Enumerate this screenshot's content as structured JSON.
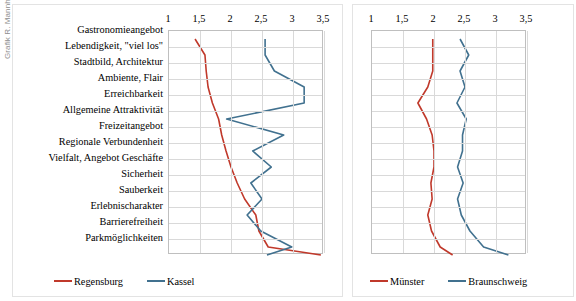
{
  "credit": "Grafik R. Mannheim",
  "axis": {
    "tick_labels": [
      "1",
      "1,5",
      "2",
      "2,5",
      "3",
      "3,5"
    ],
    "tick_values": [
      1,
      1.5,
      2,
      2.5,
      3,
      3.5
    ],
    "min": 1,
    "max": 3.5
  },
  "categories": [
    "Gastronomieangebot",
    "Lebendigkeit, \"viel los\"",
    "Stadtbild, Architektur",
    "Ambiente, Flair",
    "Erreichbarkeit",
    "Allgemeine Attraktivität",
    "Freizeitangebot",
    "Regionale Verbundenheit",
    "Vielfalt, Angebot Geschäfte",
    "Sicherheit",
    "Sauberkeit",
    "Erlebnischarakter",
    "Barrierefreiheit",
    "Parkmöglichkeiten"
  ],
  "colors": {
    "red": "#c0392b",
    "blue": "#41718f",
    "grid": "#d9d9d9",
    "frame": "#bfbfbf"
  },
  "left_legend": [
    {
      "label": "Regensburg",
      "color": "#c0392b"
    },
    {
      "label": "Kassel",
      "color": "#41718f"
    }
  ],
  "right_legend": [
    {
      "label": "Münster",
      "color": "#c0392b"
    },
    {
      "label": "Braunschweig",
      "color": "#41718f"
    }
  ],
  "chart_data": [
    {
      "type": "line",
      "title": "",
      "orientation": "horizontal",
      "xlabel": "",
      "ylabel": "",
      "xlim": [
        1,
        3.5
      ],
      "grid": true,
      "legend_position": "bottom",
      "categories": [
        "Gastronomieangebot",
        "Lebendigkeit, \"viel los\"",
        "Stadtbild, Architektur",
        "Ambiente, Flair",
        "Erreichbarkeit",
        "Allgemeine Attraktivität",
        "Freizeitangebot",
        "Regionale Verbundenheit",
        "Vielfalt, Angebot Geschäfte",
        "Sicherheit",
        "Sauberkeit",
        "Erlebnischarakter",
        "Barrierefreiheit",
        "Parkmöglichkeiten"
      ],
      "series": [
        {
          "name": "Regensburg",
          "color": "#c0392b",
          "values": [
            1.42,
            1.58,
            1.6,
            1.63,
            1.7,
            1.8,
            1.85,
            1.92,
            2.0,
            2.1,
            2.22,
            2.4,
            2.45,
            2.6,
            3.45
          ]
        },
        {
          "name": "Kassel",
          "color": "#41718f",
          "values": [
            2.55,
            2.55,
            2.7,
            3.18,
            3.18,
            1.93,
            2.85,
            2.35,
            2.65,
            2.32,
            2.5,
            2.26,
            2.48,
            2.98,
            2.58
          ]
        }
      ]
    },
    {
      "type": "line",
      "title": "",
      "orientation": "horizontal",
      "xlabel": "",
      "ylabel": "",
      "xlim": [
        1,
        3.5
      ],
      "grid": true,
      "legend_position": "bottom",
      "categories": [
        "Gastronomieangebot",
        "Lebendigkeit, \"viel los\"",
        "Stadtbild, Architektur",
        "Ambiente, Flair",
        "Erreichbarkeit",
        "Allgemeine Attraktivität",
        "Freizeitangebot",
        "Regionale Verbundenheit",
        "Vielfalt, Angebot Geschäfte",
        "Sicherheit",
        "Sauberkeit",
        "Erlebnischarakter",
        "Barrierefreiheit",
        "Parkmöglichkeiten"
      ],
      "series": [
        {
          "name": "Münster",
          "color": "#c0392b",
          "values": [
            1.98,
            1.98,
            1.98,
            1.9,
            1.74,
            1.88,
            1.97,
            2.0,
            2.0,
            1.95,
            1.97,
            1.9,
            1.96,
            2.1,
            2.3
          ]
        },
        {
          "name": "Braunschweig",
          "color": "#41718f",
          "values": [
            2.42,
            2.56,
            2.42,
            2.5,
            2.37,
            2.52,
            2.46,
            2.46,
            2.38,
            2.47,
            2.38,
            2.44,
            2.58,
            2.8,
            3.2
          ]
        }
      ]
    }
  ]
}
